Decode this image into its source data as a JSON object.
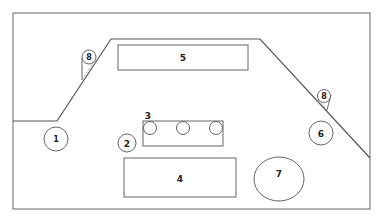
{
  "diagram": {
    "type": "floor-plan schematic",
    "colors": {
      "stroke": "#555555",
      "background": "#ffffff",
      "text": "#222222"
    },
    "labels": {
      "one": "1",
      "two": "2",
      "three": "3",
      "four": "4",
      "five": "5",
      "six": "6",
      "seven": "7",
      "eight_left": "8",
      "eight_right": "8"
    },
    "elements": [
      {
        "id": "1",
        "shape": "circle"
      },
      {
        "id": "2",
        "shape": "circle"
      },
      {
        "id": "3",
        "shape": "rectangle with three circles"
      },
      {
        "id": "4",
        "shape": "rectangle"
      },
      {
        "id": "5",
        "shape": "rectangle"
      },
      {
        "id": "6",
        "shape": "circle"
      },
      {
        "id": "7",
        "shape": "ellipse"
      },
      {
        "id": "8",
        "shape": "callout marker",
        "count": 2
      }
    ]
  }
}
